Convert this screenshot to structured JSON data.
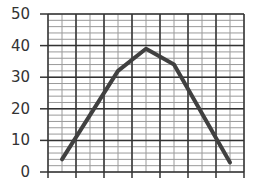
{
  "chart_data": {
    "type": "line",
    "title": "",
    "xlabel": "",
    "ylabel": "",
    "ylim": [
      0,
      50
    ],
    "xlim": [
      0,
      7
    ],
    "yticks": [
      0,
      10,
      20,
      30,
      40,
      50
    ],
    "ytick_labels": [
      "0",
      "10",
      "20",
      "30",
      "40",
      "50"
    ],
    "xtick_labels": [],
    "x_major_ticks": 8,
    "grid": {
      "on": true,
      "major_x_step": 1,
      "minor_x_step": 0.5,
      "major_y_step": 10,
      "minor_y_step": 2
    },
    "legend": null,
    "series": [
      {
        "name": "series-1",
        "color": "#404040",
        "x": [
          0.5,
          2.5,
          3.5,
          4.5,
          6.5
        ],
        "values": [
          4,
          32,
          39,
          34,
          3
        ]
      }
    ]
  },
  "style": {
    "line_color": "#404040",
    "major_grid_color": "#333333",
    "minor_grid_color": "#9a9a9a",
    "label_color": "#333333"
  }
}
